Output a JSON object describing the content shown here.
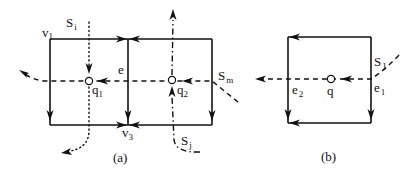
{
  "figure": {
    "panel_a": {
      "caption": "(a)",
      "vertices": [
        {
          "main": "v",
          "sub": "1"
        },
        {
          "main": "v",
          "sub": "3"
        }
      ],
      "edge_label": "e",
      "points": [
        {
          "main": "q",
          "sub": "1"
        },
        {
          "main": "q",
          "sub": "2"
        }
      ],
      "streamlines": [
        {
          "main": "S",
          "sub": "i",
          "style": "dotted"
        },
        {
          "main": "S",
          "sub": "j",
          "style": "dash-dot"
        },
        {
          "main": "S",
          "sub": "m",
          "style": "dashed"
        }
      ]
    },
    "panel_b": {
      "caption": "(b)",
      "point": "q",
      "edges": [
        {
          "main": "e",
          "sub": "1"
        },
        {
          "main": "e",
          "sub": "2"
        }
      ],
      "streamline": {
        "main": "S",
        "sub": "1",
        "style": "dashed"
      }
    }
  }
}
